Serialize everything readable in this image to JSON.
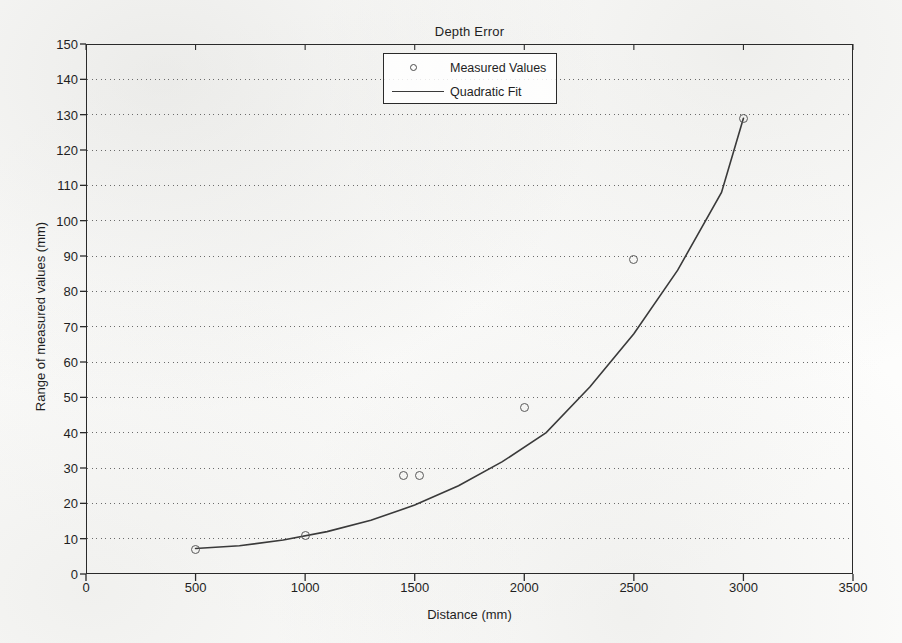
{
  "figure": {
    "title": "Depth Error",
    "background_color": "#fdfdfc",
    "axis_color": "#2a2a2a",
    "curve_color": "#3a3a3a",
    "marker_color": "#5a5a5a",
    "grid_color": "#6b6b6b"
  },
  "legend": {
    "position": "top-center",
    "entries": [
      {
        "label": "Measured Values",
        "symbol": "circle-marker"
      },
      {
        "label": "Quadratic Fit",
        "symbol": "line"
      }
    ]
  },
  "chart_data": {
    "type": "scatter",
    "title": "Depth Error",
    "xlabel": "Distance (mm)",
    "ylabel": "Range of measured values (mm)",
    "xlim": [
      0,
      3500
    ],
    "ylim": [
      0,
      150
    ],
    "xticks": [
      0,
      500,
      1000,
      1500,
      2000,
      2500,
      3000,
      3500
    ],
    "yticks": [
      0,
      10,
      20,
      30,
      40,
      50,
      60,
      70,
      80,
      90,
      100,
      110,
      120,
      130,
      140,
      150
    ],
    "grid": "horizontal-dotted",
    "legend_position": "top-center",
    "series": [
      {
        "name": "Measured Values",
        "type": "scatter",
        "marker": "circle",
        "x": [
          500,
          1000,
          1450,
          1520,
          2000,
          2500,
          3000
        ],
        "y": [
          7,
          11,
          28,
          28,
          47,
          89,
          129
        ]
      },
      {
        "name": "Quadratic Fit",
        "type": "line",
        "x": [
          500,
          700,
          900,
          1100,
          1300,
          1500,
          1700,
          1900,
          2100,
          2300,
          2500,
          2700,
          2900,
          3000
        ],
        "y": [
          7.2,
          8.0,
          9.6,
          12.0,
          15.2,
          19.5,
          25.0,
          31.8,
          40.0,
          53.0,
          68.0,
          86.0,
          108.0,
          129.0
        ]
      }
    ]
  }
}
